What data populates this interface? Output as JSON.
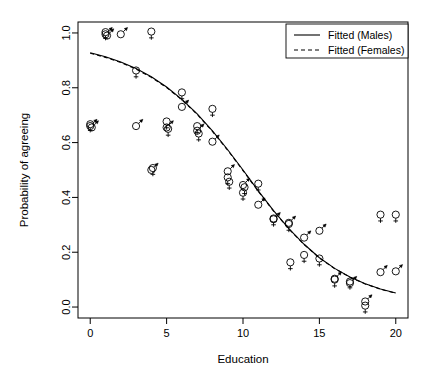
{
  "chart_data": {
    "type": "scatter",
    "title": "",
    "xlabel": "Education",
    "ylabel": "Probability of agreeing",
    "xlim": [
      -0.8,
      20.8
    ],
    "ylim": [
      -0.04,
      1.04
    ],
    "xticks": [
      0,
      5,
      10,
      15,
      20
    ],
    "xticklabels": [
      "0",
      "5",
      "10",
      "15",
      "20"
    ],
    "yticks": [
      0.0,
      0.2,
      0.4,
      0.6,
      0.8,
      1.0
    ],
    "yticklabels": [
      "0.0",
      "0.2",
      "0.4",
      "0.6",
      "0.8",
      "1.0"
    ],
    "grid": false,
    "legend_position": "top-right",
    "legend": [
      {
        "label": "Fitted (Males)",
        "style": "solid",
        "marker": "mars"
      },
      {
        "label": "Fitted (Females)",
        "style": "dashed",
        "marker": "venus"
      }
    ],
    "series": [
      {
        "name": "Males",
        "marker": "mars-symbol",
        "points": [
          {
            "x": 0.0,
            "y": 0.665
          },
          {
            "x": 0.1,
            "y": 0.66
          },
          {
            "x": 1.0,
            "y": 1.0
          },
          {
            "x": 1.1,
            "y": 0.995
          },
          {
            "x": 2.0,
            "y": 1.0
          },
          {
            "x": 3.0,
            "y": 0.665
          },
          {
            "x": 4.0,
            "y": 0.505
          },
          {
            "x": 5.0,
            "y": 0.66
          },
          {
            "x": 6.0,
            "y": 0.735
          },
          {
            "x": 7.0,
            "y": 0.648
          },
          {
            "x": 8.0,
            "y": 0.608
          },
          {
            "x": 9.0,
            "y": 0.5
          },
          {
            "x": 10.0,
            "y": 0.45
          },
          {
            "x": 11.0,
            "y": 0.378
          },
          {
            "x": 12.0,
            "y": 0.325
          },
          {
            "x": 13.0,
            "y": 0.312
          },
          {
            "x": 14.0,
            "y": 0.258
          },
          {
            "x": 15.0,
            "y": 0.283
          },
          {
            "x": 16.0,
            "y": 0.108
          },
          {
            "x": 17.0,
            "y": 0.092
          },
          {
            "x": 18.0,
            "y": 0.025
          },
          {
            "x": 19.0,
            "y": 0.132
          },
          {
            "x": 20.0,
            "y": 0.135
          }
        ]
      },
      {
        "name": "Females",
        "marker": "venus-symbol",
        "points": [
          {
            "x": 0.0,
            "y": 0.662
          },
          {
            "x": 1.0,
            "y": 0.998
          },
          {
            "x": 3.0,
            "y": 0.858
          },
          {
            "x": 4.0,
            "y": 1.0
          },
          {
            "x": 4.1,
            "y": 0.502
          },
          {
            "x": 5.0,
            "y": 0.672
          },
          {
            "x": 5.1,
            "y": 0.645
          },
          {
            "x": 6.0,
            "y": 0.778
          },
          {
            "x": 7.0,
            "y": 0.655
          },
          {
            "x": 7.1,
            "y": 0.628
          },
          {
            "x": 8.0,
            "y": 0.718
          },
          {
            "x": 9.0,
            "y": 0.468
          },
          {
            "x": 9.1,
            "y": 0.452
          },
          {
            "x": 10.0,
            "y": 0.412
          },
          {
            "x": 10.1,
            "y": 0.432
          },
          {
            "x": 11.0,
            "y": 0.445
          },
          {
            "x": 12.0,
            "y": 0.318
          },
          {
            "x": 13.0,
            "y": 0.298
          },
          {
            "x": 13.1,
            "y": 0.158
          },
          {
            "x": 14.0,
            "y": 0.185
          },
          {
            "x": 15.0,
            "y": 0.172
          },
          {
            "x": 16.0,
            "y": 0.095
          },
          {
            "x": 17.0,
            "y": 0.088
          },
          {
            "x": 18.0,
            "y": 0.0
          },
          {
            "x": 19.0,
            "y": 0.332
          },
          {
            "x": 20.0,
            "y": 0.332
          }
        ]
      }
    ],
    "fitted_curves": [
      {
        "name": "Fitted (Males)",
        "style": "solid",
        "points": [
          {
            "x": 0,
            "y": 0.928
          },
          {
            "x": 1,
            "y": 0.913
          },
          {
            "x": 2,
            "y": 0.894
          },
          {
            "x": 3,
            "y": 0.87
          },
          {
            "x": 4,
            "y": 0.84
          },
          {
            "x": 5,
            "y": 0.803
          },
          {
            "x": 6,
            "y": 0.758
          },
          {
            "x": 7,
            "y": 0.705
          },
          {
            "x": 8,
            "y": 0.643
          },
          {
            "x": 9,
            "y": 0.574
          },
          {
            "x": 10,
            "y": 0.5
          },
          {
            "x": 11,
            "y": 0.424
          },
          {
            "x": 12,
            "y": 0.352
          },
          {
            "x": 13,
            "y": 0.286
          },
          {
            "x": 14,
            "y": 0.229
          },
          {
            "x": 15,
            "y": 0.18
          },
          {
            "x": 16,
            "y": 0.141
          },
          {
            "x": 17,
            "y": 0.11
          },
          {
            "x": 18,
            "y": 0.085
          },
          {
            "x": 19,
            "y": 0.066
          },
          {
            "x": 20,
            "y": 0.051
          }
        ]
      },
      {
        "name": "Fitted (Females)",
        "style": "dashed",
        "points": [
          {
            "x": 0,
            "y": 0.926
          },
          {
            "x": 1,
            "y": 0.911
          },
          {
            "x": 2,
            "y": 0.892
          },
          {
            "x": 3,
            "y": 0.868
          },
          {
            "x": 4,
            "y": 0.838
          },
          {
            "x": 5,
            "y": 0.801
          },
          {
            "x": 6,
            "y": 0.756
          },
          {
            "x": 7,
            "y": 0.703
          },
          {
            "x": 8,
            "y": 0.641
          },
          {
            "x": 9,
            "y": 0.572
          },
          {
            "x": 10,
            "y": 0.498
          },
          {
            "x": 11,
            "y": 0.422
          },
          {
            "x": 12,
            "y": 0.35
          },
          {
            "x": 13,
            "y": 0.285
          },
          {
            "x": 14,
            "y": 0.228
          },
          {
            "x": 15,
            "y": 0.179
          },
          {
            "x": 16,
            "y": 0.14
          },
          {
            "x": 17,
            "y": 0.109
          },
          {
            "x": 18,
            "y": 0.084
          },
          {
            "x": 19,
            "y": 0.065
          },
          {
            "x": 20,
            "y": 0.05
          }
        ]
      }
    ]
  }
}
